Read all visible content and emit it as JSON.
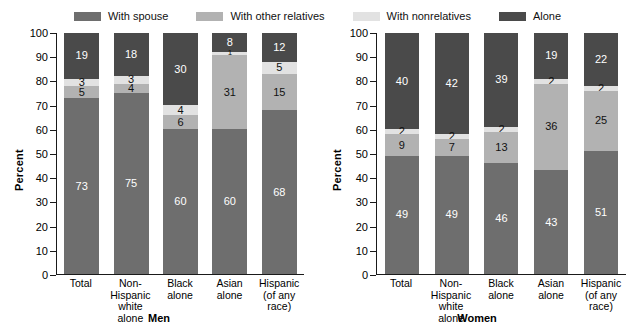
{
  "legend": {
    "items": [
      {
        "label": "With spouse",
        "color": "#6e6e6e",
        "key": "spouse"
      },
      {
        "label": "With other relatives",
        "color": "#b2b2b2",
        "key": "other_relatives"
      },
      {
        "label": "With nonrelatives",
        "color": "#e2e2e2",
        "key": "nonrelatives"
      },
      {
        "label": "Alone",
        "color": "#4a4a4a",
        "key": "alone"
      }
    ]
  },
  "axis": {
    "ylabel": "Percent",
    "ticks": [
      0,
      10,
      20,
      30,
      40,
      50,
      60,
      70,
      80,
      90,
      100
    ]
  },
  "panels": [
    {
      "id": "men",
      "title": "Men"
    },
    {
      "id": "women",
      "title": "Women"
    }
  ],
  "categories": [
    {
      "line1": "Total",
      "line2": ""
    },
    {
      "line1": "Non-Hispanic",
      "line2": "white alone"
    },
    {
      "line1": "Black",
      "line2": "alone"
    },
    {
      "line1": "Asian",
      "line2": "alone"
    },
    {
      "line1": "Hispanic",
      "line2": "(of any race)"
    }
  ],
  "chart_data": {
    "type": "bar",
    "subtype": "stacked-100-percent",
    "title": "",
    "xlabel": "",
    "ylabel": "Percent",
    "ylim": [
      0,
      100
    ],
    "yticks": [
      0,
      10,
      20,
      30,
      40,
      50,
      60,
      70,
      80,
      90,
      100
    ],
    "grid": false,
    "legend_position": "top",
    "panels": [
      {
        "name": "Men",
        "categories": [
          "Total",
          "Non-Hispanic white alone",
          "Black alone",
          "Asian alone",
          "Hispanic (of any race)"
        ],
        "series": [
          {
            "name": "With spouse",
            "values": [
              73,
              75,
              60,
              60,
              68
            ]
          },
          {
            "name": "With other relatives",
            "values": [
              5,
              4,
              6,
              31,
              15
            ]
          },
          {
            "name": "With nonrelatives",
            "values": [
              3,
              3,
              4,
              1,
              5
            ]
          },
          {
            "name": "Alone",
            "values": [
              19,
              18,
              30,
              8,
              12
            ]
          }
        ]
      },
      {
        "name": "Women",
        "categories": [
          "Total",
          "Non-Hispanic white alone",
          "Black alone",
          "Asian alone",
          "Hispanic (of any race)"
        ],
        "series": [
          {
            "name": "With spouse",
            "values": [
              49,
              49,
              46,
              43,
              51
            ]
          },
          {
            "name": "With other relatives",
            "values": [
              9,
              7,
              13,
              36,
              25
            ]
          },
          {
            "name": "With nonrelatives",
            "values": [
              2,
              2,
              2,
              2,
              2
            ]
          },
          {
            "name": "Alone",
            "values": [
              40,
              42,
              39,
              19,
              22
            ]
          }
        ]
      }
    ]
  }
}
